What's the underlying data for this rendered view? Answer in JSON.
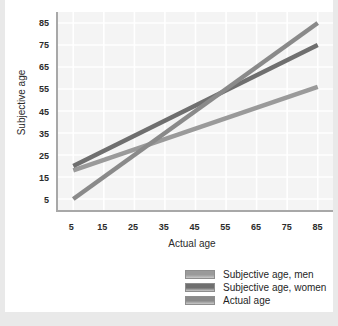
{
  "chart_data": {
    "type": "line",
    "title": "",
    "xlabel": "Actual age",
    "ylabel": "Subjective age",
    "xlim": [
      0,
      90
    ],
    "ylim": [
      0,
      90
    ],
    "xticks": [
      5,
      15,
      25,
      35,
      45,
      55,
      65,
      75,
      85
    ],
    "yticks": [
      5,
      15,
      25,
      35,
      45,
      55,
      65,
      75,
      85
    ],
    "grid": true,
    "legend_position": "bottom-right",
    "x": [
      5,
      85
    ],
    "series": [
      {
        "name": "Subjective age, men",
        "color": "#9a9a9a",
        "x": [
          5,
          85
        ],
        "values": [
          18,
          56
        ]
      },
      {
        "name": "Subjective age, women",
        "color": "#6f6f6f",
        "x": [
          5,
          85
        ],
        "values": [
          20,
          75
        ]
      },
      {
        "name": "Actual age",
        "color": "#8a8a8a",
        "x": [
          5,
          85
        ],
        "values": [
          5,
          85
        ]
      }
    ]
  },
  "axes": {
    "x_title": "Actual age",
    "y_title": "Subjective age",
    "x_tick_labels": [
      "5",
      "15",
      "25",
      "35",
      "45",
      "55",
      "65",
      "75",
      "85"
    ],
    "y_tick_labels": [
      "5",
      "15",
      "25",
      "35",
      "45",
      "55",
      "65",
      "75",
      "85"
    ]
  },
  "legend": {
    "items": [
      {
        "label": "Subjective age, men",
        "color": "#9a9a9a"
      },
      {
        "label": "Subjective age, women",
        "color": "#6f6f6f"
      },
      {
        "label": "Actual age",
        "color": "#8a8a8a"
      }
    ]
  },
  "colors": {
    "page_background": "#e9e9e9",
    "card_background": "#ffffff",
    "plot_background": "#f4f4f4",
    "gridline": "#ffffff",
    "axis": "#a8a8a8",
    "text": "#2b2b2b"
  }
}
